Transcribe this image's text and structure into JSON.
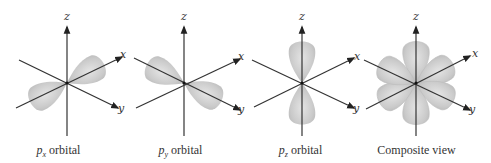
{
  "figure": {
    "colors": {
      "background": "#ffffff",
      "lobe_fill": "#c9c9c9",
      "lobe_highlight": "#e2e2e2",
      "axis": "#333333"
    },
    "panels": [
      {
        "id": "px",
        "axis_labels": {
          "z": "z",
          "x": "x",
          "y": "y"
        },
        "caption": {
          "prefix": "p",
          "subscript": "x",
          "suffix": " orbital"
        }
      },
      {
        "id": "py",
        "axis_labels": {
          "z": "z",
          "x": "x",
          "y": "y"
        },
        "caption": {
          "prefix": "p",
          "subscript": "y",
          "suffix": " orbital"
        }
      },
      {
        "id": "pz",
        "axis_labels": {
          "z": "z",
          "x": "x",
          "y": "y"
        },
        "caption": {
          "prefix": "p",
          "subscript": "z",
          "suffix": " orbital"
        }
      },
      {
        "id": "composite",
        "axis_labels": {
          "z": "z",
          "x": "x",
          "y": "y"
        },
        "caption": {
          "text": "Composite view"
        }
      }
    ]
  }
}
